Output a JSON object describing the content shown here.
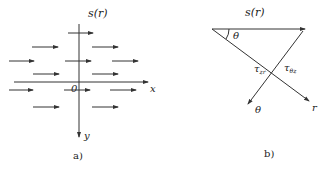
{
  "panel_a": {
    "title": "s(r)",
    "origin_label": "0",
    "x_axis_label": "x",
    "y_axis_label": "y",
    "caption": "a)",
    "flow_arrows": [
      {
        "y": 33,
        "x1": 68,
        "x2": 93
      },
      {
        "y": 47,
        "x1": 32,
        "x2": 58
      },
      {
        "y": 47,
        "x1": 92,
        "x2": 118
      },
      {
        "y": 61,
        "x1": 9,
        "x2": 34
      },
      {
        "y": 61,
        "x1": 65,
        "x2": 91
      },
      {
        "y": 61,
        "x1": 112,
        "x2": 138
      },
      {
        "y": 74,
        "x1": 33,
        "x2": 59
      },
      {
        "y": 74,
        "x1": 92,
        "x2": 118
      },
      {
        "y": 90,
        "x1": 9,
        "x2": 33
      },
      {
        "y": 90,
        "x1": 64,
        "x2": 90
      },
      {
        "y": 90,
        "x1": 110,
        "x2": 136
      },
      {
        "y": 107,
        "x1": 33,
        "x2": 59
      },
      {
        "y": 107,
        "x1": 92,
        "x2": 118
      }
    ]
  },
  "panel_b": {
    "title": "s(r)",
    "angle_label": "θ",
    "r_axis_label": "r",
    "theta_axis_label": "θ",
    "tau_zr": {
      "base": "τ",
      "sub": "zr"
    },
    "tau_thetaz": {
      "base": "τ",
      "sub": "θz"
    },
    "caption": "b)"
  },
  "colors": {
    "line": "#333333",
    "text": "#222222",
    "background": "#ffffff"
  }
}
